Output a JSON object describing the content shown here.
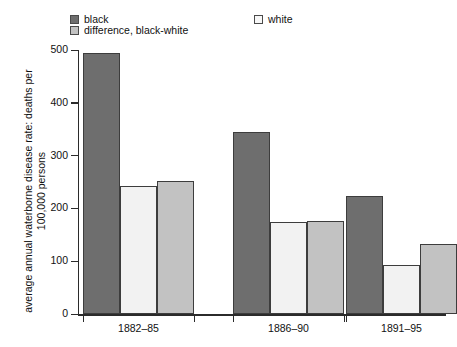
{
  "chart_data": {
    "type": "bar",
    "title": "",
    "xlabel": "",
    "ylabel": "average annual waterborne disease rate:\ndeaths per 100,000 persons",
    "categories": [
      "1882–85",
      "1886–90",
      "1891–95"
    ],
    "series": [
      {
        "name": "black",
        "color": "#6e6e6e",
        "values": [
          495,
          345,
          224
        ]
      },
      {
        "name": "white",
        "color": "#f2f2f2",
        "values": [
          242,
          175,
          93
        ]
      },
      {
        "name": "difference, black-white",
        "color": "#c2c2c2",
        "values": [
          251,
          176,
          133
        ]
      }
    ],
    "ylim": [
      0,
      500
    ],
    "yticks": [
      0,
      100,
      200,
      300,
      400,
      500
    ],
    "ytick_labels": [
      "0",
      "100",
      "200",
      "300",
      "400",
      "500"
    ],
    "grid": false,
    "legend_position": "top"
  },
  "legend": {
    "entries": [
      {
        "label": "black",
        "color": "#6e6e6e"
      },
      {
        "label": "difference, black-white",
        "color": "#c2c2c2"
      },
      {
        "label": "white",
        "color": "#f7f7f7"
      }
    ]
  },
  "axis": {
    "y_title": "average annual waterborne disease rate: deaths per 100,000 persons",
    "y_labels": [
      "500",
      "400",
      "300",
      "200",
      "100",
      "0"
    ],
    "x_labels": [
      "1882–85",
      "1886–90",
      "1891–95"
    ]
  }
}
